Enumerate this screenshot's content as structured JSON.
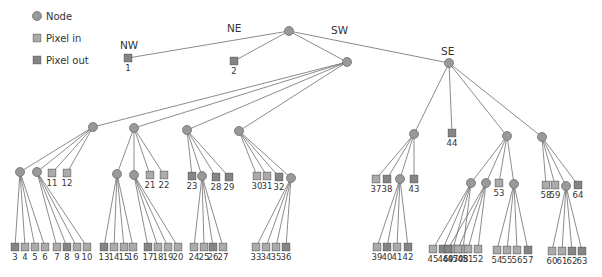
{
  "legend": [
    {
      "key": "node",
      "label": "Node",
      "shape": "circle",
      "color": "#999999"
    },
    {
      "key": "in",
      "label": "Pixel in",
      "shape": "square",
      "color": "#ababab"
    },
    {
      "key": "out",
      "label": "Pixel out",
      "shape": "square",
      "color": "#858585"
    }
  ],
  "quadrant_labels": [
    {
      "text": "NW",
      "x": 120,
      "y": 49
    },
    {
      "text": "NE",
      "x": 227,
      "y": 32
    },
    {
      "text": "SW",
      "x": 331,
      "y": 34
    },
    {
      "text": "SE",
      "x": 441,
      "y": 55
    }
  ],
  "nodes": [
    {
      "id": "root",
      "x": 289,
      "y": 31
    },
    {
      "id": "sw",
      "x": 347,
      "y": 62,
      "parent": "root"
    },
    {
      "id": "se",
      "x": 449,
      "y": 63,
      "parent": "root"
    },
    {
      "id": "a",
      "x": 93,
      "y": 127,
      "parent": "sw"
    },
    {
      "id": "b",
      "x": 134,
      "y": 128,
      "parent": "sw"
    },
    {
      "id": "c",
      "x": 187,
      "y": 130,
      "parent": "sw"
    },
    {
      "id": "d",
      "x": 239,
      "y": 131,
      "parent": "sw"
    },
    {
      "id": "a1",
      "x": 20,
      "y": 172,
      "parent": "a"
    },
    {
      "id": "a2",
      "x": 37,
      "y": 172,
      "parent": "a"
    },
    {
      "id": "b1",
      "x": 117,
      "y": 174,
      "parent": "b"
    },
    {
      "id": "b2",
      "x": 134,
      "y": 175,
      "parent": "b"
    },
    {
      "id": "c1",
      "x": 202,
      "y": 176,
      "parent": "c"
    },
    {
      "id": "d1",
      "x": 291,
      "y": 178,
      "parent": "d"
    },
    {
      "id": "e",
      "x": 414,
      "y": 134,
      "parent": "se"
    },
    {
      "id": "f",
      "x": 507,
      "y": 136,
      "parent": "se"
    },
    {
      "id": "g",
      "x": 542,
      "y": 137,
      "parent": "se"
    },
    {
      "id": "e1",
      "x": 400,
      "y": 179,
      "parent": "e"
    },
    {
      "id": "f1",
      "x": 471,
      "y": 183,
      "parent": "f"
    },
    {
      "id": "f2",
      "x": 486,
      "y": 183,
      "parent": "f"
    },
    {
      "id": "f3",
      "x": 514,
      "y": 184,
      "parent": "f"
    },
    {
      "id": "g1",
      "x": 566,
      "y": 186,
      "parent": "g"
    }
  ],
  "leaves": [
    {
      "label": "1",
      "x": 128,
      "y": 58,
      "type": "out",
      "parent": "root"
    },
    {
      "label": "2",
      "x": 234,
      "y": 61,
      "type": "out",
      "parent": "root"
    },
    {
      "label": "3",
      "x": 15,
      "y": 247,
      "type": "out",
      "parent": "a1"
    },
    {
      "label": "4",
      "x": 25,
      "y": 247,
      "type": "in",
      "parent": "a1"
    },
    {
      "label": "5",
      "x": 35,
      "y": 247,
      "type": "in",
      "parent": "a1"
    },
    {
      "label": "6",
      "x": 45,
      "y": 247,
      "type": "in",
      "parent": "a1"
    },
    {
      "label": "7",
      "x": 57,
      "y": 247,
      "type": "in",
      "parent": "a2"
    },
    {
      "label": "8",
      "x": 67,
      "y": 247,
      "type": "out",
      "parent": "a2"
    },
    {
      "label": "9",
      "x": 77,
      "y": 247,
      "type": "in",
      "parent": "a2"
    },
    {
      "label": "10",
      "x": 87,
      "y": 247,
      "type": "in",
      "parent": "a2"
    },
    {
      "label": "11",
      "x": 52,
      "y": 173,
      "type": "in",
      "parent": "a"
    },
    {
      "label": "12",
      "x": 67,
      "y": 173,
      "type": "in",
      "parent": "a"
    },
    {
      "label": "13",
      "x": 104,
      "y": 247,
      "type": "out",
      "parent": "b1"
    },
    {
      "label": "14",
      "x": 114,
      "y": 247,
      "type": "in",
      "parent": "b1"
    },
    {
      "label": "15",
      "x": 124,
      "y": 247,
      "type": "in",
      "parent": "b1"
    },
    {
      "label": "16",
      "x": 133,
      "y": 247,
      "type": "in",
      "parent": "b1"
    },
    {
      "label": "17",
      "x": 148,
      "y": 247,
      "type": "out",
      "parent": "b2"
    },
    {
      "label": "18",
      "x": 158,
      "y": 247,
      "type": "in",
      "parent": "b2"
    },
    {
      "label": "19",
      "x": 168,
      "y": 247,
      "type": "in",
      "parent": "b2"
    },
    {
      "label": "20",
      "x": 178,
      "y": 247,
      "type": "in",
      "parent": "b2"
    },
    {
      "label": "21",
      "x": 150,
      "y": 175,
      "type": "in",
      "parent": "b"
    },
    {
      "label": "22",
      "x": 164,
      "y": 175,
      "type": "in",
      "parent": "b"
    },
    {
      "label": "23",
      "x": 192,
      "y": 176,
      "type": "out",
      "parent": "c"
    },
    {
      "label": "24",
      "x": 194,
      "y": 247,
      "type": "in",
      "parent": "c1"
    },
    {
      "label": "25",
      "x": 204,
      "y": 247,
      "type": "in",
      "parent": "c1"
    },
    {
      "label": "26",
      "x": 213,
      "y": 247,
      "type": "out",
      "parent": "c1"
    },
    {
      "label": "27",
      "x": 223,
      "y": 247,
      "type": "in",
      "parent": "c1"
    },
    {
      "label": "28",
      "x": 216,
      "y": 177,
      "type": "out",
      "parent": "c"
    },
    {
      "label": "29",
      "x": 229,
      "y": 177,
      "type": "out",
      "parent": "c"
    },
    {
      "label": "30",
      "x": 257,
      "y": 176,
      "type": "in",
      "parent": "d"
    },
    {
      "label": "31",
      "x": 267,
      "y": 176,
      "type": "in",
      "parent": "d"
    },
    {
      "label": "32",
      "x": 279,
      "y": 177,
      "type": "out",
      "parent": "d"
    },
    {
      "label": "33",
      "x": 256,
      "y": 247,
      "type": "in",
      "parent": "d1"
    },
    {
      "label": "34",
      "x": 266,
      "y": 247,
      "type": "in",
      "parent": "d1"
    },
    {
      "label": "35",
      "x": 276,
      "y": 247,
      "type": "in",
      "parent": "d1"
    },
    {
      "label": "36",
      "x": 286,
      "y": 247,
      "type": "out",
      "parent": "d1"
    },
    {
      "label": "37",
      "x": 376,
      "y": 179,
      "type": "in",
      "parent": "e"
    },
    {
      "label": "38",
      "x": 387,
      "y": 179,
      "type": "out",
      "parent": "e"
    },
    {
      "label": "39",
      "x": 377,
      "y": 247,
      "type": "in",
      "parent": "e1"
    },
    {
      "label": "40",
      "x": 387,
      "y": 247,
      "type": "out",
      "parent": "e1"
    },
    {
      "label": "41",
      "x": 397,
      "y": 247,
      "type": "in",
      "parent": "e1"
    },
    {
      "label": "42",
      "x": 408,
      "y": 247,
      "type": "out",
      "parent": "e1"
    },
    {
      "label": "43",
      "x": 414,
      "y": 179,
      "type": "out",
      "parent": "e"
    },
    {
      "label": "44",
      "x": 452,
      "y": 133,
      "type": "out",
      "parent": "se"
    },
    {
      "label": "45",
      "x": 433,
      "y": 249,
      "type": "in",
      "parent": "f1"
    },
    {
      "label": "46",
      "x": 443,
      "y": 249,
      "type": "out",
      "parent": "f1"
    },
    {
      "label": "47",
      "x": 453,
      "y": 249,
      "type": "in",
      "parent": "f1"
    },
    {
      "label": "48",
      "x": 463,
      "y": 249,
      "type": "in",
      "parent": "f1"
    },
    {
      "label": "49",
      "x": 448,
      "y": 249,
      "type": "out",
      "parent": "f2"
    },
    {
      "label": "50",
      "x": 458,
      "y": 249,
      "type": "in",
      "parent": "f2"
    },
    {
      "label": "51",
      "x": 468,
      "y": 249,
      "type": "in",
      "parent": "f2"
    },
    {
      "label": "52",
      "x": 478,
      "y": 249,
      "type": "in",
      "parent": "f2"
    },
    {
      "label": "53",
      "x": 499,
      "y": 183,
      "type": "in",
      "parent": "f"
    },
    {
      "label": "54",
      "x": 497,
      "y": 250,
      "type": "in",
      "parent": "f3"
    },
    {
      "label": "55",
      "x": 507,
      "y": 250,
      "type": "in",
      "parent": "f3"
    },
    {
      "label": "56",
      "x": 517,
      "y": 250,
      "type": "in",
      "parent": "f3"
    },
    {
      "label": "57",
      "x": 528,
      "y": 250,
      "type": "out",
      "parent": "f3"
    },
    {
      "label": "58",
      "x": 546,
      "y": 185,
      "type": "in",
      "parent": "g"
    },
    {
      "label": "59",
      "x": 555,
      "y": 185,
      "type": "in",
      "parent": "g"
    },
    {
      "label": "60",
      "x": 552,
      "y": 251,
      "type": "in",
      "parent": "g1"
    },
    {
      "label": "61",
      "x": 562,
      "y": 251,
      "type": "in",
      "parent": "g1"
    },
    {
      "label": "62",
      "x": 572,
      "y": 251,
      "type": "out",
      "parent": "g1"
    },
    {
      "label": "63",
      "x": 582,
      "y": 251,
      "type": "out",
      "parent": "g1"
    },
    {
      "label": "64",
      "x": 578,
      "y": 185,
      "type": "out",
      "parent": "g"
    }
  ]
}
